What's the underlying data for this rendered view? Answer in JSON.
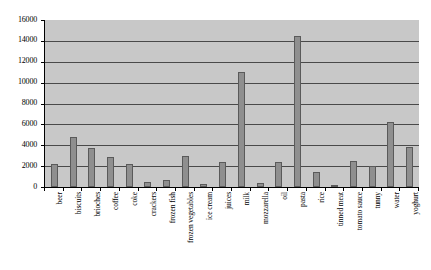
{
  "chart_data": {
    "type": "bar",
    "title": "",
    "subtitle": "",
    "xlabel": "",
    "ylabel": "",
    "ylim": [
      0,
      16000
    ],
    "ytick_step": 2000,
    "yticks": [
      0,
      2000,
      4000,
      6000,
      8000,
      10000,
      12000,
      14000,
      16000
    ],
    "ytick_labels": [
      "0",
      "2000",
      "4000",
      "6000",
      "8000",
      "10000",
      "12000",
      "14000",
      "16000"
    ],
    "grid": true,
    "legend": null,
    "legend_position": "none",
    "categories": [
      "beer",
      "biscuits",
      "brioches",
      "coffee",
      "coke",
      "crackers",
      "frozen fish",
      "frozen vegetables",
      "ice cream",
      "juices",
      "milk",
      "mozzarella",
      "oil",
      "pasta",
      "rice",
      "tinned meat",
      "tomato sauce",
      "tunny",
      "water",
      "yoghurt"
    ],
    "values": [
      2200,
      4800,
      3700,
      2900,
      2200,
      500,
      700,
      3000,
      250,
      2400,
      11000,
      350,
      2400,
      14500,
      1400,
      200,
      2500,
      2000,
      6200,
      3800
    ],
    "bar_color": "#8f8f8f",
    "bar_edge_color": "#5a5a5a",
    "plot_background": "#c8c8c8",
    "gridline_color": "#4a4a4a",
    "axis_color": "#000000",
    "figure_background": "#ffffff"
  }
}
